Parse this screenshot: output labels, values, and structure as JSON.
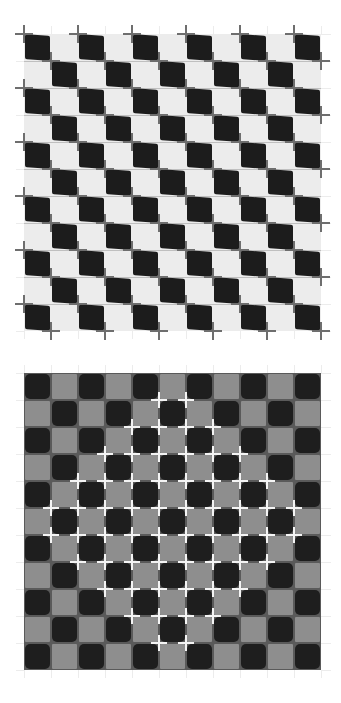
{
  "figure": {
    "title": "",
    "canvas": {
      "width": 341,
      "height": 703,
      "background": "#ffffff"
    }
  },
  "top_pattern": {
    "name": "tilted-checkerboard-with-crosses",
    "origin": {
      "x": 24,
      "y": 34
    },
    "rows": 11,
    "cols": 11,
    "cell_size": 27,
    "colors": {
      "dark": "#1c1c1c",
      "light": "#ececec",
      "cross": "#6e6e6e",
      "grid_line": "#6e6e6e"
    },
    "first_cell": "dark",
    "cross_arm": 9,
    "cross_thickness": 2
  },
  "bottom_pattern": {
    "name": "bulging-checkerboard",
    "origin": {
      "x": 24,
      "y": 373
    },
    "rows": 11,
    "cols": 11,
    "cell_size": 27,
    "colors": {
      "dark": "#1e1e1e",
      "light": "#8e8e8e",
      "grid_line": "#5a5a5a",
      "cross": "#f4f4f4"
    },
    "first_cell": "dark",
    "cross_arm": 8,
    "cross_thickness": 2,
    "diamond_radius": 4.5
  }
}
